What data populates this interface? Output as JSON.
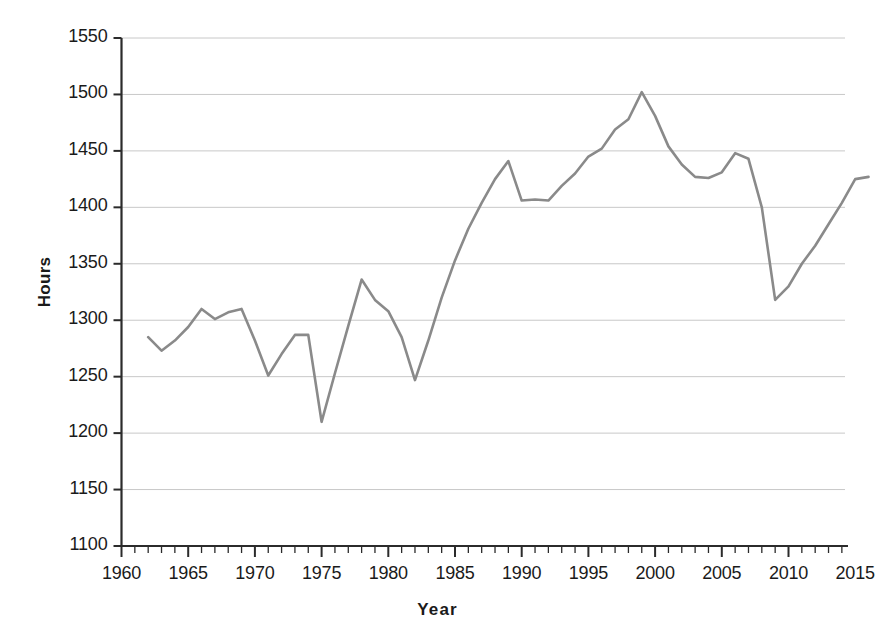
{
  "chart_data": {
    "type": "line",
    "title": "",
    "xlabel": "Year",
    "ylabel": "Hours",
    "xlim": [
      1958.5,
      2017.5
    ],
    "ylim": [
      1100,
      1550
    ],
    "xtick_labels": [
      "1960",
      "1965",
      "1970",
      "1975",
      "1980",
      "1985",
      "1990",
      "1995",
      "2000",
      "2005",
      "2010",
      "2015"
    ],
    "xticks": [
      1960,
      1965,
      1970,
      1975,
      1980,
      1985,
      1990,
      1995,
      2000,
      2005,
      2010,
      2015
    ],
    "minor_xtick_interval": 1,
    "ytick_labels": [
      "1100",
      "1150",
      "1200",
      "1250",
      "1300",
      "1350",
      "1400",
      "1450",
      "1500",
      "1550"
    ],
    "yticks": [
      1100,
      1150,
      1200,
      1250,
      1300,
      1350,
      1400,
      1450,
      1500,
      1550
    ],
    "grid": "horizontal",
    "legend": "none",
    "line_color": "#8a8a8a",
    "grid_color": "#c8c8c8",
    "axis_color": "#2b2b2b",
    "x": [
      1962,
      1963,
      1964,
      1965,
      1966,
      1967,
      1968,
      1969,
      1970,
      1971,
      1972,
      1973,
      1974,
      1975,
      1976,
      1977,
      1978,
      1979,
      1980,
      1981,
      1982,
      1983,
      1984,
      1985,
      1986,
      1987,
      1988,
      1989,
      1990,
      1991,
      1992,
      1993,
      1994,
      1995,
      1996,
      1997,
      1998,
      1999,
      2000,
      2001,
      2002,
      2003,
      2004,
      2005,
      2006,
      2007,
      2008,
      2009,
      2010,
      2011,
      2012,
      2013,
      2014,
      2015,
      2016
    ],
    "values": [
      1285,
      1273,
      1282,
      1294,
      1310,
      1301,
      1307,
      1310,
      1282,
      1251,
      1270,
      1287,
      1287,
      1210,
      1253,
      1295,
      1336,
      1318,
      1308,
      1285,
      1247,
      1282,
      1320,
      1353,
      1381,
      1404,
      1425,
      1441,
      1406,
      1407,
      1406,
      1419,
      1430,
      1445,
      1452,
      1469,
      1478,
      1502,
      1481,
      1454,
      1438,
      1427,
      1426,
      1431,
      1448,
      1443,
      1400,
      1318,
      1330,
      1350,
      1366,
      1385,
      1404,
      1425,
      1427
    ]
  }
}
